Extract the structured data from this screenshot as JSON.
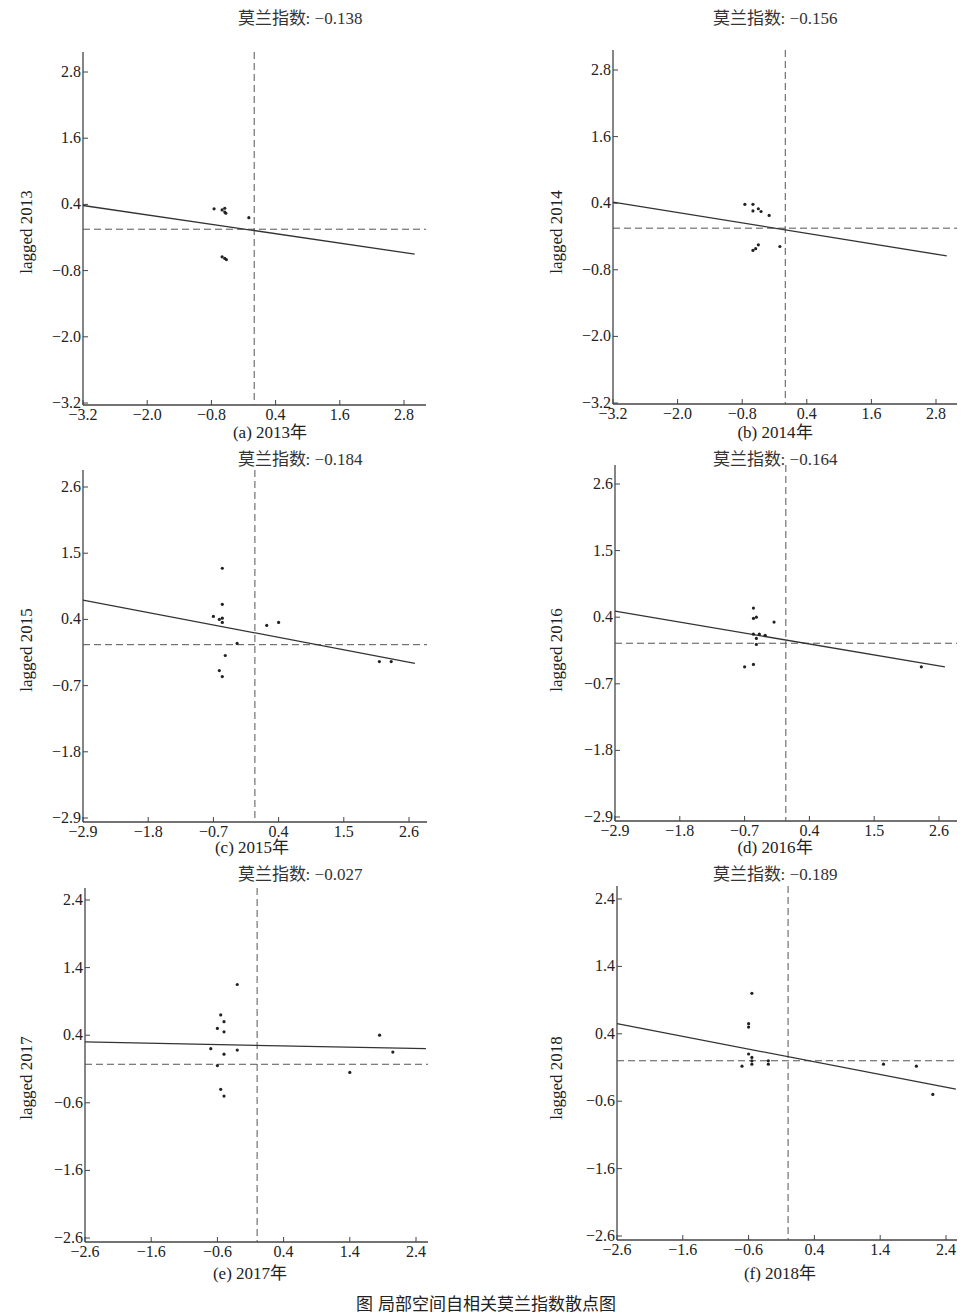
{
  "figure_caption": "图 局部空间自相关莫兰指数散点图",
  "chart_data": [
    {
      "type": "scatter",
      "id": "a",
      "title": "莫兰指数: −0.138",
      "moran_i": -0.138,
      "caption": "(a) 2013年",
      "xlabel": "",
      "ylabel": "lagged 2013",
      "xticks": [
        "−3.2",
        "−2.0",
        "−0.8",
        "0.4",
        "1.6",
        "2.8"
      ],
      "yticks": [
        "2.8",
        "1.6",
        "0.4",
        "−0.8",
        "−2.0",
        "−3.2"
      ],
      "xlim": [
        -3.2,
        3.0
      ],
      "ylim": [
        -3.2,
        3.1
      ],
      "hline_y": -0.05,
      "vline_x": 0.0,
      "regression": {
        "x": [
          -3.2,
          3.0
        ],
        "y": [
          0.38,
          -0.5
        ]
      },
      "points": [
        [
          -0.75,
          0.32
        ],
        [
          -0.6,
          0.3
        ],
        [
          -0.55,
          0.33
        ],
        [
          -0.55,
          0.26
        ],
        [
          -0.53,
          0.24
        ],
        [
          -0.1,
          0.16
        ],
        [
          -0.6,
          -0.55
        ],
        [
          -0.55,
          -0.58
        ],
        [
          -0.52,
          -0.6
        ]
      ],
      "layout": {
        "ax_left": 83,
        "ax_top": 52,
        "ax_right": 426,
        "ax_bottom": 405,
        "x0px": 83,
        "x1px": 404,
        "x0": -3.2,
        "x1": 2.8,
        "y0px": 72,
        "y1px": 403,
        "y0": 2.8,
        "y1": -3.2,
        "title_x": 300,
        "title_y": 4,
        "caption_x": 270,
        "caption_y": 418,
        "ylabel_x": 27,
        "ylabel_y": 232
      }
    },
    {
      "type": "scatter",
      "id": "b",
      "title": "莫兰指数: −0.156",
      "moran_i": -0.156,
      "caption": "(b) 2014年",
      "xlabel": "",
      "ylabel": "lagged 2014",
      "xticks": [
        "−3.2",
        "−2.0",
        "−0.8",
        "0.4",
        "1.6",
        "2.8"
      ],
      "yticks": [
        "2.8",
        "1.6",
        "0.4",
        "−0.8",
        "−2.0",
        "−3.2"
      ],
      "xlim": [
        -3.2,
        3.0
      ],
      "ylim": [
        -3.2,
        3.1
      ],
      "hline_y": -0.05,
      "vline_x": 0.0,
      "regression": {
        "x": [
          -3.2,
          3.0
        ],
        "y": [
          0.42,
          -0.55
        ]
      },
      "points": [
        [
          -0.75,
          0.38
        ],
        [
          -0.6,
          0.38
        ],
        [
          -0.6,
          0.26
        ],
        [
          -0.5,
          0.3
        ],
        [
          -0.45,
          0.25
        ],
        [
          -0.3,
          0.18
        ],
        [
          -0.6,
          -0.45
        ],
        [
          -0.55,
          -0.42
        ],
        [
          -0.5,
          -0.35
        ],
        [
          -0.1,
          -0.38
        ]
      ],
      "layout": {
        "ax_left": 613,
        "ax_top": 50,
        "ax_right": 957,
        "ax_bottom": 404,
        "x0px": 613,
        "x1px": 936,
        "x0": -3.2,
        "x1": 2.8,
        "y0px": 70,
        "y1px": 403,
        "y0": 2.8,
        "y1": -3.2,
        "title_x": 775,
        "title_y": 4,
        "caption_x": 775,
        "caption_y": 418,
        "ylabel_x": 557,
        "ylabel_y": 232
      }
    },
    {
      "type": "scatter",
      "id": "c",
      "title": "莫兰指数: −0.184",
      "moran_i": -0.184,
      "caption": "(c) 2015年",
      "xlabel": "",
      "ylabel": "lagged 2015",
      "xticks": [
        "−2.9",
        "−1.8",
        "−0.7",
        "0.4",
        "1.5",
        "2.6"
      ],
      "yticks": [
        "2.6",
        "1.5",
        "0.4",
        "−0.7",
        "−1.8",
        "−2.9"
      ],
      "xlim": [
        -2.9,
        2.7
      ],
      "ylim": [
        -2.9,
        2.9
      ],
      "hline_y": -0.02,
      "vline_x": 0.0,
      "regression": {
        "x": [
          -2.9,
          2.7
        ],
        "y": [
          0.72,
          -0.33
        ]
      },
      "points": [
        [
          -0.7,
          0.45
        ],
        [
          -0.6,
          0.4
        ],
        [
          -0.55,
          0.35
        ],
        [
          -0.55,
          0.42
        ],
        [
          -0.55,
          0.65
        ],
        [
          -0.55,
          1.25
        ],
        [
          -0.3,
          0.0
        ],
        [
          0.2,
          0.3
        ],
        [
          0.4,
          0.35
        ],
        [
          -0.5,
          -0.2
        ],
        [
          -0.6,
          -0.45
        ],
        [
          -0.55,
          -0.55
        ],
        [
          2.1,
          -0.3
        ],
        [
          2.3,
          -0.3
        ]
      ],
      "layout": {
        "ax_left": 83,
        "ax_top": 470,
        "ax_right": 427,
        "ax_bottom": 822,
        "x0px": 83,
        "x1px": 409,
        "x0": -2.9,
        "x1": 2.6,
        "y0px": 487,
        "y1px": 818,
        "y0": 2.6,
        "y1": -2.9,
        "title_x": 300,
        "title_y": 445,
        "caption_x": 252,
        "caption_y": 833,
        "ylabel_x": 27,
        "ylabel_y": 650
      }
    },
    {
      "type": "scatter",
      "id": "d",
      "title": "莫兰指数: −0.164",
      "moran_i": -0.164,
      "caption": "(d) 2016年",
      "xlabel": "",
      "ylabel": "lagged 2016",
      "xticks": [
        "−2.9",
        "−1.8",
        "−0.7",
        "0.4",
        "1.5",
        "2.6"
      ],
      "yticks": [
        "2.6",
        "1.5",
        "0.4",
        "−0.7",
        "−1.8",
        "−2.9"
      ],
      "xlim": [
        -2.9,
        2.7
      ],
      "ylim": [
        -2.9,
        2.9
      ],
      "hline_y": -0.03,
      "vline_x": 0.0,
      "regression": {
        "x": [
          -2.9,
          2.7
        ],
        "y": [
          0.5,
          -0.42
        ]
      },
      "points": [
        [
          -0.55,
          0.55
        ],
        [
          -0.55,
          0.38
        ],
        [
          -0.5,
          0.4
        ],
        [
          -0.2,
          0.32
        ],
        [
          -0.55,
          0.12
        ],
        [
          -0.45,
          0.12
        ],
        [
          -0.35,
          0.1
        ],
        [
          -0.5,
          0.05
        ],
        [
          -0.5,
          -0.05
        ],
        [
          -0.7,
          -0.42
        ],
        [
          -0.55,
          -0.38
        ],
        [
          2.3,
          -0.42
        ]
      ],
      "layout": {
        "ax_left": 615,
        "ax_top": 465,
        "ax_right": 957,
        "ax_bottom": 821,
        "x0px": 615,
        "x1px": 939,
        "x0": -2.9,
        "x1": 2.6,
        "y0px": 484,
        "y1px": 817,
        "y0": 2.6,
        "y1": -2.9,
        "title_x": 775,
        "title_y": 445,
        "caption_x": 775,
        "caption_y": 833,
        "ylabel_x": 557,
        "ylabel_y": 650
      }
    },
    {
      "type": "scatter",
      "id": "e",
      "title": "莫兰指数: −0.027",
      "moran_i": -0.027,
      "caption": "(e) 2017年",
      "xlabel": "",
      "ylabel": "lagged 2017",
      "xticks": [
        "−2.6",
        "−1.6",
        "−0.6",
        "0.4",
        "1.4",
        "2.4"
      ],
      "yticks": [
        "2.4",
        "1.4",
        "0.4",
        "−0.6",
        "−1.6",
        "−2.6"
      ],
      "xlim": [
        -2.6,
        2.55
      ],
      "ylim": [
        -2.6,
        2.6
      ],
      "hline_y": -0.03,
      "vline_x": 0.0,
      "regression": {
        "x": [
          -2.6,
          2.55
        ],
        "y": [
          0.3,
          0.2
        ]
      },
      "points": [
        [
          -0.7,
          0.2
        ],
        [
          -0.6,
          0.5
        ],
        [
          -0.55,
          0.7
        ],
        [
          -0.5,
          0.6
        ],
        [
          -0.5,
          0.45
        ],
        [
          -0.5,
          0.12
        ],
        [
          -0.6,
          -0.05
        ],
        [
          -0.3,
          0.18
        ],
        [
          -0.3,
          1.15
        ],
        [
          -0.55,
          -0.4
        ],
        [
          -0.5,
          -0.5
        ],
        [
          1.4,
          -0.15
        ],
        [
          1.85,
          0.4
        ],
        [
          2.05,
          0.15
        ]
      ],
      "layout": {
        "ax_left": 85,
        "ax_top": 888,
        "ax_right": 428,
        "ax_bottom": 1242,
        "x0px": 85,
        "x1px": 416,
        "x0": -2.6,
        "x1": 2.4,
        "y0px": 900,
        "y1px": 1238,
        "y0": 2.4,
        "y1": -2.6,
        "title_x": 300,
        "title_y": 860,
        "caption_x": 250,
        "caption_y": 1259,
        "ylabel_x": 27,
        "ylabel_y": 1078
      }
    },
    {
      "type": "scatter",
      "id": "f",
      "title": "莫兰指数: −0.189",
      "moran_i": -0.189,
      "caption": "(f) 2018年",
      "xlabel": "",
      "ylabel": "lagged 2018",
      "xticks": [
        "−2.6",
        "−1.6",
        "−0.6",
        "0.4",
        "1.4",
        "2.4"
      ],
      "yticks": [
        "2.4",
        "1.4",
        "0.4",
        "−0.6",
        "−1.6",
        "−2.6"
      ],
      "xlim": [
        -2.6,
        2.55
      ],
      "ylim": [
        -2.6,
        2.6
      ],
      "hline_y": 0.0,
      "vline_x": 0.0,
      "regression": {
        "x": [
          -2.6,
          2.55
        ],
        "y": [
          0.55,
          -0.42
        ]
      },
      "points": [
        [
          -0.55,
          1.0
        ],
        [
          -0.6,
          0.55
        ],
        [
          -0.6,
          0.5
        ],
        [
          -0.6,
          0.1
        ],
        [
          -0.55,
          0.05
        ],
        [
          -0.55,
          0.0
        ],
        [
          -0.7,
          -0.08
        ],
        [
          -0.55,
          -0.05
        ],
        [
          -0.3,
          0.0
        ],
        [
          -0.3,
          -0.05
        ],
        [
          1.45,
          -0.05
        ],
        [
          1.95,
          -0.08
        ],
        [
          2.2,
          -0.5
        ]
      ],
      "layout": {
        "ax_left": 617,
        "ax_top": 886,
        "ax_right": 957,
        "ax_bottom": 1240,
        "x0px": 617,
        "x1px": 946,
        "x0": -2.6,
        "x1": 2.4,
        "y0px": 899,
        "y1px": 1236,
        "y0": 2.4,
        "y1": -2.6,
        "title_x": 775,
        "title_y": 860,
        "caption_x": 780,
        "caption_y": 1259,
        "ylabel_x": 557,
        "ylabel_y": 1078
      }
    }
  ]
}
